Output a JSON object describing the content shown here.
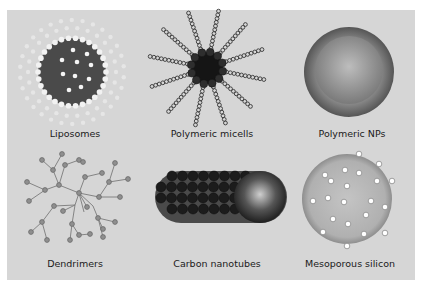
{
  "figure": {
    "background": "#d6d6d6",
    "panels": [
      {
        "id": "liposomes",
        "label": "Liposomes",
        "icon": "liposome-icon"
      },
      {
        "id": "polymeric-micells",
        "label": "Polymeric micells",
        "icon": "polymeric-micelle-icon"
      },
      {
        "id": "polymeric-nps",
        "label": "Polymeric NPs",
        "icon": "polymeric-nanoparticle-icon"
      },
      {
        "id": "dendrimers",
        "label": "Dendrimers",
        "icon": "dendrimer-icon"
      },
      {
        "id": "carbon-nanotubes",
        "label": "Carbon nanotubes",
        "icon": "carbon-nanotube-icon"
      },
      {
        "id": "mesoporous-silicon",
        "label": "Mesoporous silicon",
        "icon": "mesoporous-silicon-icon"
      }
    ]
  }
}
